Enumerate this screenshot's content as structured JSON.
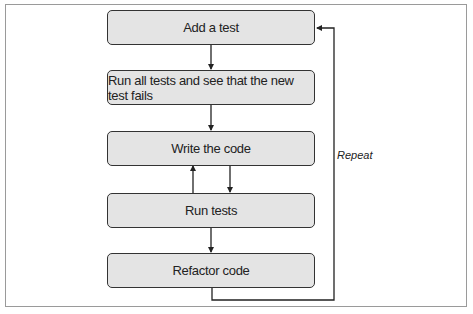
{
  "diagram": {
    "steps": [
      {
        "label": "Add a test"
      },
      {
        "label": "Run all tests and see that the new test fails"
      },
      {
        "label": "Write the code"
      },
      {
        "label": "Run tests"
      },
      {
        "label": "Refactor code"
      }
    ],
    "loop_label": "Repeat",
    "colors": {
      "box_fill": "#e4e4e4",
      "box_border": "#333333",
      "frame": "#9a9a9a",
      "line": "#222222"
    }
  }
}
